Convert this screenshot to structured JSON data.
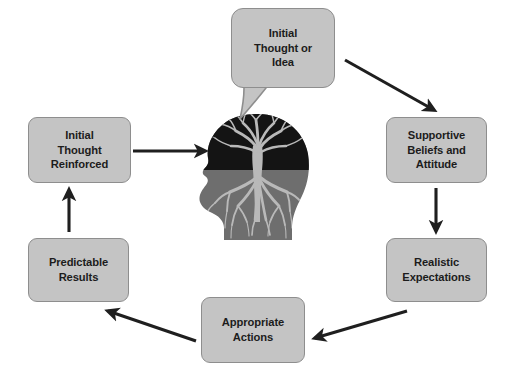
{
  "diagram": {
    "type": "cycle-flow",
    "background_color": "#ffffff",
    "node_fill_color": "#c4c4c4",
    "node_border_color": "#8e8e8e",
    "text_color": "#1c1c1c",
    "arrow_color": "#1f1f1f",
    "nodes": [
      {
        "id": "initial-thought-idea",
        "label": "Initial\nThought or\nIdea",
        "shape": "speech-bubble",
        "position": "top-center"
      },
      {
        "id": "supportive-beliefs",
        "label": "Supportive\nBeliefs and\nAttitude",
        "shape": "rounded-rectangle",
        "position": "right-upper"
      },
      {
        "id": "realistic-expectations",
        "label": "Realistic\nExpectations",
        "shape": "rounded-rectangle",
        "position": "right-lower"
      },
      {
        "id": "appropriate-actions",
        "label": "Appropriate\nActions",
        "shape": "rounded-rectangle",
        "position": "bottom-center"
      },
      {
        "id": "predictable-results",
        "label": "Predictable\nResults",
        "shape": "rounded-rectangle",
        "position": "left-lower"
      },
      {
        "id": "initial-thought-reinforced",
        "label": "Initial\nThought\nReinforced",
        "shape": "rounded-rectangle",
        "position": "left-upper"
      }
    ],
    "center_image": {
      "id": "head-with-tree",
      "description": "Side profile silhouette of a human head facing left, containing a tree whose branches fill the upper skull and whose roots spread through the face and neck",
      "upper_color": "#141414",
      "lower_color": "#6e6e6e",
      "tree_color": "#b9b9b9"
    },
    "arrows": [
      {
        "id": "arrow-idea-to-beliefs",
        "from": "initial-thought-idea",
        "to": "supportive-beliefs",
        "direction": "down-right"
      },
      {
        "id": "arrow-beliefs-to-expectations",
        "from": "supportive-beliefs",
        "to": "realistic-expectations",
        "direction": "down"
      },
      {
        "id": "arrow-expectations-to-actions",
        "from": "realistic-expectations",
        "to": "appropriate-actions",
        "direction": "down-left"
      },
      {
        "id": "arrow-actions-to-results",
        "from": "appropriate-actions",
        "to": "predictable-results",
        "direction": "up-left"
      },
      {
        "id": "arrow-results-to-reinforced",
        "from": "predictable-results",
        "to": "initial-thought-reinforced",
        "direction": "up"
      },
      {
        "id": "arrow-reinforced-to-head",
        "from": "initial-thought-reinforced",
        "to": "head-with-tree",
        "direction": "right"
      }
    ]
  }
}
